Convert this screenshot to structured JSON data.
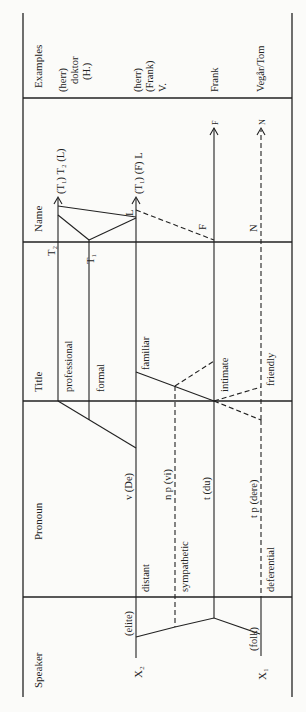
{
  "columns": {
    "examples": "Examples",
    "name": "Name",
    "title": "Title",
    "pronoun": "Pronoun",
    "speaker": "Speaker"
  },
  "examples": {
    "row1": [
      "(herr)",
      "doktor",
      "(H.)"
    ],
    "row2": [
      "(herr)",
      "(Frank)",
      "V."
    ],
    "row3": "Frank",
    "row4": "Vegår/Tom"
  },
  "name_labels": {
    "row1": "(T₁) T₂ (L)",
    "row2": "(T₁) (F) L",
    "f_arrow": "F",
    "n_arrow": "N",
    "t2": "T₂",
    "t1": "T₁",
    "l": "L",
    "f": "F",
    "n": "N"
  },
  "title_labels": {
    "professional": "professional",
    "formal": "formal",
    "familiar": "familiar",
    "intimate": "intimate",
    "friendly": "friendly"
  },
  "pronoun_labels": {
    "v": "v (De)",
    "np": "n p (vi)",
    "t": "t (du)",
    "tp": "t p (dere)",
    "distant": "distant",
    "sympathetic": "sympathetic",
    "deferential": "deferential"
  },
  "speaker_labels": {
    "elite": "(elite)",
    "folk": "(folk)",
    "x2": "X₂",
    "x1": "X₁"
  }
}
